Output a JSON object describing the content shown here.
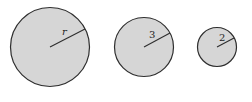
{
  "diagram": {
    "colors": {
      "fill": "#d6d6d6",
      "stroke": "#2e2e2e",
      "background": "#ffffff"
    },
    "circles": [
      {
        "label": "r",
        "italic": true,
        "cx": 50,
        "cy": 47,
        "r": 40
      },
      {
        "label": "3",
        "italic": false,
        "cx": 144,
        "cy": 47,
        "r": 30
      },
      {
        "label": "2",
        "italic": false,
        "cx": 217,
        "cy": 47,
        "r": 20
      }
    ]
  }
}
